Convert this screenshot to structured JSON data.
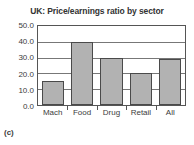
{
  "chart_data": {
    "type": "bar",
    "title": "UK: Price/earnings ratio by sector",
    "xlabel": "",
    "ylabel": "",
    "categories": [
      "Mach",
      "Food",
      "Drug",
      "Retail",
      "All"
    ],
    "values": [
      15.0,
      40.0,
      30.0,
      20.5,
      29.0
    ],
    "ylim": [
      0.0,
      50.0
    ],
    "ytick_values": [
      0.0,
      10.0,
      20.0,
      30.0,
      40.0,
      50.0
    ],
    "ytick_labels": [
      "0.0",
      "10.0",
      "20.0",
      "30.0",
      "40.0",
      "50.0"
    ],
    "grid": true,
    "legend": false,
    "bar_color": "#b2b2b2",
    "bar_edge_color": "#4a4a4a",
    "grid_color": "#777777",
    "axis_color": "#555555"
  },
  "figure": {
    "caption": "(c)"
  }
}
